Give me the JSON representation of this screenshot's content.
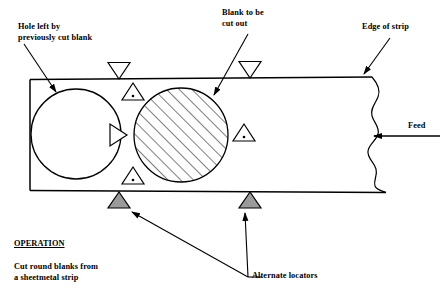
{
  "diagram": {
    "title_block": {
      "heading": "OPERATION",
      "description_line1": "Cut round blanks from",
      "description_line2": "a sheetmetal strip"
    },
    "labels": {
      "hole_line1": "Hole left by",
      "hole_line2": "previously cut blank",
      "blank_line1": "Blank to be",
      "blank_line2": "cut out",
      "edge_of_strip": "Edge of strip",
      "feed": "Feed",
      "alternate_locators": "Alternate locators"
    },
    "colors": {
      "line": "#000000",
      "background": "#ffffff",
      "locator_fill": "#9a9a9a"
    },
    "icons": {
      "inverted_triangle": "inverted-triangle-locator-icon",
      "dot_triangle": "dot-triangle-locator-icon",
      "side_triangle": "side-pointing-triangle-locator-icon",
      "shaded_triangle": "shaded-triangle-locator-icon",
      "feed_arrow": "left-arrow-icon",
      "break_line": "wavy-break-line-icon"
    }
  }
}
